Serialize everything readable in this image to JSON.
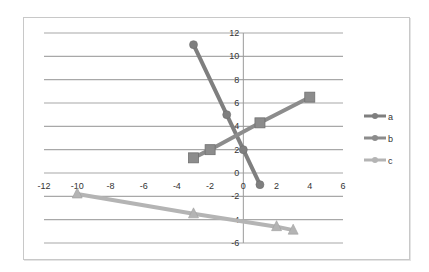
{
  "chart_data": {
    "type": "scatter",
    "title": "",
    "xlabel": "",
    "ylabel": "",
    "xlim": [
      -12,
      6
    ],
    "ylim": [
      -6,
      12
    ],
    "x_ticks": [
      -12,
      -10,
      -8,
      -6,
      -4,
      -2,
      0,
      2,
      4,
      6
    ],
    "y_ticks": [
      -6,
      -4,
      -2,
      0,
      2,
      4,
      6,
      8,
      10,
      12
    ],
    "grid": {
      "horizontal": true,
      "vertical": false
    },
    "legend_position": "right",
    "series": [
      {
        "name": "a",
        "marker": "diamond",
        "color": "#7f7f7f",
        "points": [
          [
            -3,
            11
          ],
          [
            -1,
            5
          ],
          [
            0,
            2
          ],
          [
            1,
            -1
          ]
        ]
      },
      {
        "name": "b",
        "marker": "square",
        "color": "#8c8c8c",
        "points": [
          [
            -3,
            1.3
          ],
          [
            -2,
            2
          ],
          [
            1,
            4.3
          ],
          [
            4,
            6.5
          ]
        ]
      },
      {
        "name": "c",
        "marker": "triangle",
        "color": "#b4b4b4",
        "points": [
          [
            -10,
            -1.8
          ],
          [
            -3,
            -3.5
          ],
          [
            2,
            -4.6
          ],
          [
            3,
            -4.9
          ]
        ]
      }
    ]
  }
}
